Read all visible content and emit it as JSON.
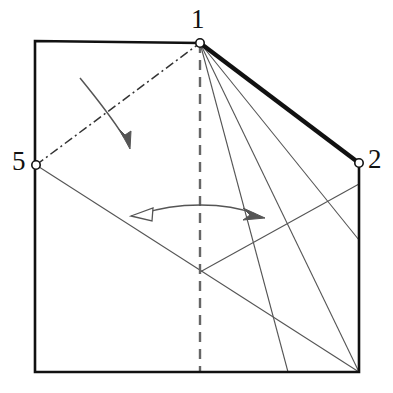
{
  "figure": {
    "kind": "origami-fold-diagram",
    "width": 393,
    "height": 393,
    "background": "#ffffff",
    "ink": "#111111",
    "thin_ink": "#555555"
  },
  "labels": {
    "point_1": "1",
    "point_5": "5",
    "point_2": "2"
  },
  "vertices": {
    "top_left": {
      "x": 35,
      "y": 41,
      "name": "top-left-corner"
    },
    "point_1": {
      "x": 200,
      "y": 43,
      "name": "point-1"
    },
    "point_2": {
      "x": 359,
      "y": 163,
      "name": "point-2"
    },
    "point_5": {
      "x": 36,
      "y": 165,
      "name": "point-5"
    },
    "bottom_right": {
      "x": 359,
      "y": 372,
      "name": "bottom-right-corner"
    },
    "bottom_left": {
      "x": 35,
      "y": 372,
      "name": "bottom-left-corner"
    },
    "center_node": {
      "x": 200,
      "y": 272,
      "name": "interior-crossing-node"
    },
    "right_edge_node": {
      "x": 359,
      "y": 240,
      "name": "right-edge-node"
    }
  },
  "markers": [
    {
      "name": "vertex-marker-1",
      "x": 200,
      "y": 43,
      "r": 4.2,
      "label": "1"
    },
    {
      "name": "vertex-marker-5",
      "x": 36,
      "y": 165,
      "r": 4.2,
      "label": "5"
    },
    {
      "name": "vertex-marker-2",
      "x": 359,
      "y": 163,
      "r": 4.2,
      "label": "2"
    }
  ],
  "outline": {
    "name": "paper-outline",
    "points": "35,41 200,43 359,163 359,372 35,372",
    "stroke": "#111111",
    "stroke_width": 2.6,
    "fill": "none"
  },
  "edges": [
    {
      "name": "edge-1-to-2-thick",
      "style": "thick-solid",
      "from": "point_1",
      "to": "point_2",
      "stroke": "#111111",
      "stroke_width": 4.4,
      "path": "M200,43 L359,163"
    },
    {
      "name": "crease-5-to-1-dashdot",
      "style": "dash-dot",
      "from": "point_5",
      "to": "point_1",
      "stroke": "#333333",
      "stroke_width": 1.5,
      "dash_array": "9,3.5,2,3.5",
      "path": "M36,165 L200,43"
    },
    {
      "name": "centerline-vertical-dashed",
      "style": "dashed",
      "stroke": "#666666",
      "stroke_width": 2.4,
      "dash_array": "10,7",
      "path": "M200,43 L200,372"
    },
    {
      "name": "crease-1-to-bottom-right",
      "style": "thin-solid",
      "from": "point_1",
      "to": "bottom_right",
      "stroke": "#555555",
      "stroke_width": 1.1,
      "path": "M200,43 L359,372"
    },
    {
      "name": "crease-1-to-right-edge-node",
      "style": "thin-solid",
      "from": "point_1",
      "to": "right_edge_node",
      "stroke": "#555555",
      "stroke_width": 1.1,
      "path": "M200,43 L359,240"
    },
    {
      "name": "crease-1-to-lower-right-inner",
      "style": "thin-solid",
      "from": "point_1",
      "to": "bottom_right",
      "stroke": "#555555",
      "stroke_width": 1.1,
      "path": "M200,43 L288,372"
    },
    {
      "name": "crease-5-to-bottom-right",
      "style": "thin-solid",
      "from": "point_5",
      "to": "bottom_right",
      "stroke": "#555555",
      "stroke_width": 1.1,
      "path": "M36,165 L359,372"
    },
    {
      "name": "crease-center-node-to-point-2",
      "style": "thin-solid",
      "from": "center_node",
      "to": "point_2",
      "stroke": "#555555",
      "stroke_width": 1.1,
      "path": "M200,272 L359,184"
    }
  ],
  "arrows": {
    "fold_arrow": {
      "name": "fold-direction-arrow",
      "description": "curved arrow with solid head indicating fold of flap 5-1 downward",
      "head_style": "solid",
      "path": "M80,78 C98,100 112,118 126,140",
      "stroke": "#555555",
      "stroke_width": 1.5,
      "tip": {
        "x": 130,
        "y": 147
      }
    },
    "double_arrow": {
      "name": "swivel-double-arrow",
      "description": "double-headed curved arrow across centerline; left head hollow, right head solid",
      "left_head_style": "hollow",
      "right_head_style": "solid",
      "path": "M140,214 C175,203 225,203 256,214",
      "stroke": "#555555",
      "stroke_width": 1.5,
      "left_tip": {
        "x": 133,
        "y": 215
      },
      "right_tip": {
        "x": 263,
        "y": 217
      }
    }
  }
}
